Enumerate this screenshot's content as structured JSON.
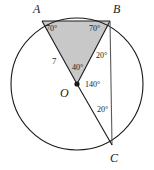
{
  "figure": {
    "type": "circle-geometry-diagram",
    "background_color": "#ffffff",
    "stroke_color": "#1a1a1a",
    "shaded_fill_color": "#c8c8c8",
    "points": {
      "A": {
        "label": "A",
        "x": 42,
        "y": 21
      },
      "B": {
        "label": "B",
        "x": 110,
        "y": 21
      },
      "C": {
        "label": "C",
        "x": 112,
        "y": 145
      },
      "O": {
        "label": "O",
        "x": 77,
        "y": 84
      }
    },
    "point_labels": [
      {
        "name": "point-label-a",
        "text": "A",
        "x": 33,
        "y": 3
      },
      {
        "name": "point-label-b",
        "text": "B",
        "x": 113,
        "y": 3
      },
      {
        "name": "point-label-c",
        "text": "C",
        "x": 110,
        "y": 152
      },
      {
        "name": "point-label-o",
        "text": "O",
        "x": 60,
        "y": 87
      }
    ],
    "angle_labels": [
      {
        "name": "angle-a-70",
        "text": "70°",
        "x": 46,
        "y": 25,
        "vertex": "A"
      },
      {
        "name": "angle-b-70",
        "text": "70°",
        "x": 89,
        "y": 25,
        "vertex": "B"
      },
      {
        "name": "angle-o-40",
        "text": "40°",
        "x": 72,
        "y": 64,
        "vertex": "O"
      },
      {
        "name": "angle-o-140",
        "text": "140°",
        "x": 85,
        "y": 81,
        "vertex": "O"
      },
      {
        "name": "angle-b-20",
        "text": "20°",
        "x": 96,
        "y": 52,
        "vertex": "B"
      },
      {
        "name": "angle-c-20",
        "text": "20°",
        "x": 97,
        "y": 106,
        "vertex": "C"
      }
    ],
    "length_labels": [
      {
        "name": "segment-length-ao",
        "text": "7",
        "x": 52,
        "y": 57,
        "segment": "AO"
      }
    ],
    "circle": {
      "cx": 77,
      "cy": 84,
      "r": 66
    },
    "shaded_region": {
      "name": "shaded-triangle-aob",
      "vertices": [
        "A",
        "O",
        "B"
      ],
      "fill": "#c8c8c8"
    },
    "segments": [
      {
        "name": "chord-ab",
        "from": "A",
        "to": "B"
      },
      {
        "name": "segment-ao",
        "from": "A",
        "to": "O"
      },
      {
        "name": "segment-bo",
        "from": "B",
        "to": "O"
      },
      {
        "name": "segment-bc",
        "from": "B",
        "to": "C"
      },
      {
        "name": "segment-oc",
        "from": "O",
        "to": "C"
      }
    ],
    "center_dot": {
      "name": "center-point-dot",
      "x": 77,
      "y": 84,
      "r": 2.6
    }
  }
}
